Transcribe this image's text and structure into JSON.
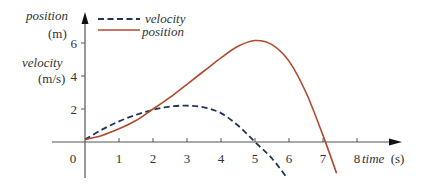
{
  "chart_data": {
    "type": "line",
    "title": "",
    "xlabel": "time (s)",
    "ylabel_lines": [
      "position",
      "(m)",
      "velocity",
      "(m/s)"
    ],
    "xlim": [
      0,
      8
    ],
    "ylim": [
      -2.2,
      7
    ],
    "x_ticks": [
      0,
      1,
      2,
      3,
      4,
      5,
      6,
      7,
      8
    ],
    "y_ticks": [
      2,
      4,
      6
    ],
    "grid": false,
    "legend_position": "top-left",
    "series": [
      {
        "name": "velocity",
        "style": "dashed",
        "color": "#1f3557",
        "x": [
          0,
          0.5,
          1,
          1.5,
          2,
          2.5,
          3,
          3.5,
          4,
          4.5,
          5,
          5.5,
          5.95
        ],
        "y": [
          0.15,
          0.75,
          1.25,
          1.65,
          1.95,
          2.15,
          2.2,
          2.1,
          1.75,
          1.0,
          0.0,
          -1.0,
          -2.2
        ]
      },
      {
        "name": "position",
        "style": "solid",
        "color": "#b04a2f",
        "x": [
          0,
          0.5,
          1,
          1.5,
          2,
          2.5,
          3,
          3.5,
          4,
          4.5,
          5,
          5.5,
          6,
          6.5,
          7,
          7.4
        ],
        "y": [
          0.15,
          0.4,
          0.8,
          1.3,
          2.0,
          2.7,
          3.5,
          4.3,
          5.1,
          5.8,
          6.15,
          5.9,
          4.9,
          3.0,
          0.4,
          -1.9
        ]
      }
    ]
  },
  "labels": {
    "y_position": "position",
    "y_position_unit": "(m)",
    "y_velocity": "velocity",
    "y_velocity_unit": "(m/s)",
    "x_time": "time",
    "x_time_unit": "(s)",
    "legend_velocity": "velocity",
    "legend_position": "position",
    "x_tick_labels": [
      "0",
      "1",
      "2",
      "3",
      "4",
      "5",
      "6",
      "7",
      "8"
    ],
    "y_tick_labels": [
      "2",
      "4",
      "6"
    ]
  },
  "colors": {
    "axis": "#555555",
    "velocity": "#1f3557",
    "position": "#b04a2f"
  }
}
